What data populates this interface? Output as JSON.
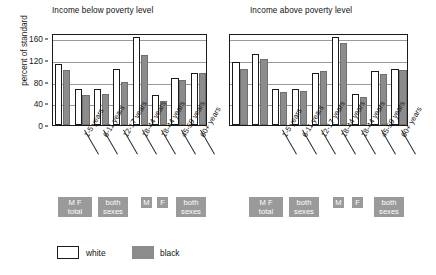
{
  "figure": {
    "ylabel": "percent of standard",
    "yticks": [
      0,
      40,
      80,
      120,
      160
    ],
    "ylim": [
      0,
      170
    ],
    "legend": {
      "items": [
        {
          "label": "white",
          "swatch": "hollow-white",
          "color": "#ffffff"
        },
        {
          "label": "black",
          "swatch": "filled-gray",
          "color": "#8c8c8c"
        }
      ]
    },
    "group_chips_left": [
      {
        "label": "M    F\ntotal"
      },
      {
        "label": "both\nsexes"
      },
      {
        "label": "M"
      },
      {
        "label": "F"
      },
      {
        "label": "both\nsexes"
      }
    ],
    "group_chips_right": [
      {
        "label": "M    F\ntotal"
      },
      {
        "label": "both\nsexes"
      },
      {
        "label": "M"
      },
      {
        "label": "F"
      },
      {
        "label": "both\nsexes"
      }
    ]
  },
  "chart_data": [
    {
      "type": "bar",
      "title": "Income below poverty level",
      "xlabel": "",
      "ylabel": "percent of standard",
      "ylim": [
        0,
        170
      ],
      "yticks": [
        0,
        40,
        80,
        120,
        160
      ],
      "grid": true,
      "legend_position": "bottom",
      "categories": [
        "total",
        "1-5 years",
        "6-11 years",
        "12-17 years",
        "18-44 years",
        "18-44 years",
        "45-59 years",
        "60+ years"
      ],
      "category_notes": [
        "M F total",
        "both sexes",
        "both sexes",
        "both sexes",
        "M",
        "F",
        "both sexes",
        "both sexes"
      ],
      "series": [
        {
          "name": "white",
          "color": "#ffffff",
          "values": [
            112,
            66,
            67,
            103,
            163,
            56,
            87,
            97
          ]
        },
        {
          "name": "black",
          "color": "#8c8c8c",
          "values": [
            102,
            56,
            57,
            80,
            129,
            45,
            84,
            96
          ]
        }
      ]
    },
    {
      "type": "bar",
      "title": "Income above poverty level",
      "xlabel": "",
      "ylabel": "percent of standard",
      "ylim": [
        0,
        170
      ],
      "yticks": [
        0,
        40,
        80,
        120,
        160
      ],
      "grid": true,
      "legend_position": "bottom",
      "categories": [
        "total",
        "1-5 years",
        "6-11 years",
        "12-17 years",
        "18-44 years",
        "18-44 years",
        "45-59 years",
        "60+ years"
      ],
      "category_notes": [
        "M F total",
        "both sexes",
        "both sexes",
        "both sexes",
        "M",
        "F",
        "both sexes",
        "both sexes"
      ],
      "series": [
        {
          "name": "white",
          "color": "#ffffff",
          "values": [
            116,
            131,
            67,
            67,
            96,
            163,
            58,
            99,
            103
          ]
        },
        {
          "name": "black",
          "color": "#8c8c8c",
          "values": [
            104,
            122,
            61,
            62,
            99,
            152,
            51,
            95,
            101
          ]
        }
      ]
    }
  ],
  "xtick_labels": [
    "1-5 years",
    "6-11 years",
    "12-17 years",
    "18-44 years",
    "18-44 years",
    "45-59 years",
    "60+ years"
  ]
}
